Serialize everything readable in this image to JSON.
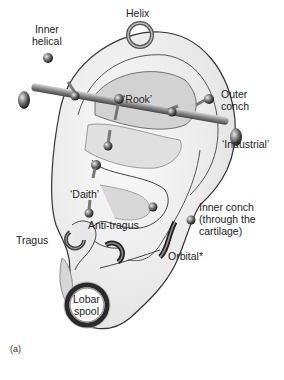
{
  "figure": {
    "caption": "(a)",
    "colors": {
      "ear_fill": "#f2f2f2",
      "ear_outline": "#333333",
      "shade": "#cfcfcf",
      "metal": "#8a8a8a",
      "metal_dark": "#3a3a3a"
    }
  },
  "labels": {
    "inner_helical_1": "Inner",
    "inner_helical_2": "helical",
    "helix": "Helix",
    "outer_conch_1": "Outer",
    "outer_conch_2": "conch",
    "rook": "‘Rook’",
    "industrial": "‘Industrial’",
    "daith": "‘Daith’",
    "inner_conch_1": "Inner conch",
    "inner_conch_2": "(through the",
    "inner_conch_3": "cartilage)",
    "tragus": "Tragus",
    "anti_tragus": "Anti-tragus",
    "orbital": "Orbital*",
    "lobar_spool_1": "Lobar",
    "lobar_spool_2": "spool"
  }
}
